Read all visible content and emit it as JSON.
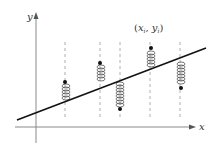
{
  "diagram": {
    "axes": {
      "x_label": "x",
      "y_label": "y"
    },
    "point_label": {
      "open": "(",
      "x": "x",
      "x_sub": "i",
      "comma": ", ",
      "y": "y",
      "y_sub": "i",
      "close": ")"
    },
    "colors": {
      "line": "#111111",
      "axis": "#777777",
      "dashed": "#999999",
      "spring": "#555555",
      "point": "#111111"
    },
    "regression_line": {
      "x1": 17,
      "y1": 120,
      "x2": 206,
      "y2": 48
    },
    "data_points": [
      {
        "x": 65,
        "y": 82
      },
      {
        "x": 100,
        "y": 63
      },
      {
        "x": 120,
        "y": 109
      },
      {
        "x": 151,
        "y": 48
      },
      {
        "x": 181,
        "y": 88
      }
    ]
  }
}
